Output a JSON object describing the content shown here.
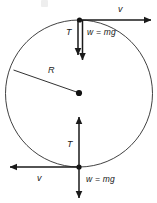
{
  "figure": {
    "background_color": "#ffffff",
    "stroke_color": "#1a1a1a",
    "circle": {
      "label": "circular path",
      "center_x": 79,
      "center_y": 93.5,
      "radius": 73.5,
      "stroke_width": 1
    },
    "center_dot": {
      "label": "center-of-circle",
      "x": 79,
      "y": 93
    },
    "radius_line": {
      "label": "R",
      "from_x": 14,
      "from_y": 70,
      "to_x": 79,
      "to_y": 93
    }
  },
  "labels": {
    "radius": "R",
    "tension_top": "T",
    "tension_bottom": "T",
    "weight_top": "w  =  mg",
    "weight_bottom": "w  =  mg",
    "velocity_top": "v",
    "velocity_bottom": "v"
  },
  "vectors": {
    "top": [
      {
        "name": "tension-top",
        "symbol": "T",
        "direction": "down",
        "x": 78,
        "y1": 20,
        "y2": 58
      },
      {
        "name": "weight-top",
        "symbol": "w  =  mg",
        "direction": "down",
        "x": 82,
        "y1": 20,
        "y2": 62
      },
      {
        "name": "velocity-top",
        "symbol": "v",
        "direction": "right",
        "y": 20,
        "x1": 78,
        "x2": 153
      }
    ],
    "bottom": [
      {
        "name": "tension-bottom",
        "symbol": "T",
        "direction": "up",
        "x": 79,
        "y1": 167,
        "y2": 114
      },
      {
        "name": "weight-bottom",
        "symbol": "w  =  mg",
        "direction": "down",
        "x": 79,
        "y1": 167,
        "y2": 200
      },
      {
        "name": "velocity-bottom",
        "symbol": "v",
        "direction": "left",
        "y": 167,
        "x1": 79,
        "x2": 8
      }
    ]
  }
}
